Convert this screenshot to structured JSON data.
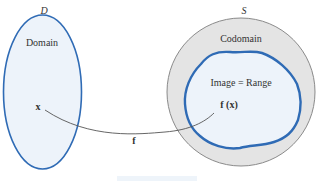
{
  "diagram": {
    "domain_set": {
      "name": "D",
      "label": "Domain",
      "point": "x"
    },
    "codomain_set": {
      "name": "S",
      "label": "Codomain"
    },
    "image_region": {
      "label": "Image = Range",
      "point": "f (x)"
    },
    "mapping": {
      "label": "f"
    },
    "colors": {
      "set_stroke": "#2f6bb5",
      "set_fill": "#edf3fa",
      "codomain_fill": "#e4e4e4",
      "codomain_stroke": "#8a8a8a",
      "arrow": "#555555"
    }
  }
}
